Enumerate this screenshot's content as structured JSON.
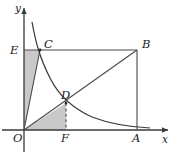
{
  "figure": {
    "kind": "coordinate-geometry-diagram",
    "colors": {
      "axis": "#3a3a3a",
      "line": "#4a4a4a",
      "curve": "#3a3a3a",
      "shade": "#c9c9c9",
      "label": "#1c1c1c",
      "background": "#ffffff"
    },
    "axes": {
      "x_label": "x",
      "y_label": "y",
      "origin_label": "O",
      "origin_px": {
        "x": 24,
        "y": 130
      },
      "x_end_px": {
        "x": 168,
        "y": 130
      },
      "y_end_px": {
        "x": 24,
        "y": 8
      }
    },
    "points": [
      {
        "name": "O",
        "label": "O",
        "px": {
          "x": 24,
          "y": 130
        },
        "label_px": {
          "x": 13,
          "y": 142
        }
      },
      {
        "name": "E",
        "label": "E",
        "px": {
          "x": 24,
          "y": 50
        },
        "label_px": {
          "x": 10,
          "y": 54
        }
      },
      {
        "name": "C",
        "label": "C",
        "px": {
          "x": 40,
          "y": 50
        },
        "label_px": {
          "x": 44,
          "y": 48
        }
      },
      {
        "name": "B",
        "label": "B",
        "px": {
          "x": 137,
          "y": 50
        },
        "label_px": {
          "x": 142,
          "y": 48
        }
      },
      {
        "name": "D",
        "label": "D",
        "px": {
          "x": 66,
          "y": 103
        },
        "label_px": {
          "x": 61,
          "y": 99
        }
      },
      {
        "name": "F",
        "label": "F",
        "px": {
          "x": 66,
          "y": 130
        },
        "label_px": {
          "x": 61,
          "y": 142
        }
      },
      {
        "name": "A",
        "label": "A",
        "px": {
          "x": 137,
          "y": 130
        },
        "label_px": {
          "x": 132,
          "y": 142
        }
      }
    ],
    "segments": [
      {
        "name": "segment-EB",
        "from": "E",
        "to": "B",
        "style": "solid"
      },
      {
        "name": "segment-BA",
        "from": "B",
        "to": "A",
        "style": "solid"
      },
      {
        "name": "segment-OB",
        "from": "O",
        "to": "B",
        "style": "solid"
      },
      {
        "name": "segment-OC",
        "from": "O",
        "to": "C",
        "style": "solid"
      },
      {
        "name": "segment-DF",
        "from": "D",
        "to": "F",
        "style": "dashed"
      }
    ],
    "curve": {
      "name": "hyperbola-branch",
      "path": "M 32 22 C 36 44, 40 58, 50 78 C 58 94, 72 108, 92 117 C 110 124, 132 127, 150 128",
      "note": "decreasing inverse-proportion curve y = k/x passing through C and D"
    },
    "regions": [
      {
        "name": "region-triangle-OEC",
        "points": "24,50 40,50 24,130",
        "fill": "#c9c9c9"
      },
      {
        "name": "region-triangle-OFD",
        "points": "24,130 66,130 66,103",
        "fill": "#c9c9c9"
      }
    ]
  }
}
